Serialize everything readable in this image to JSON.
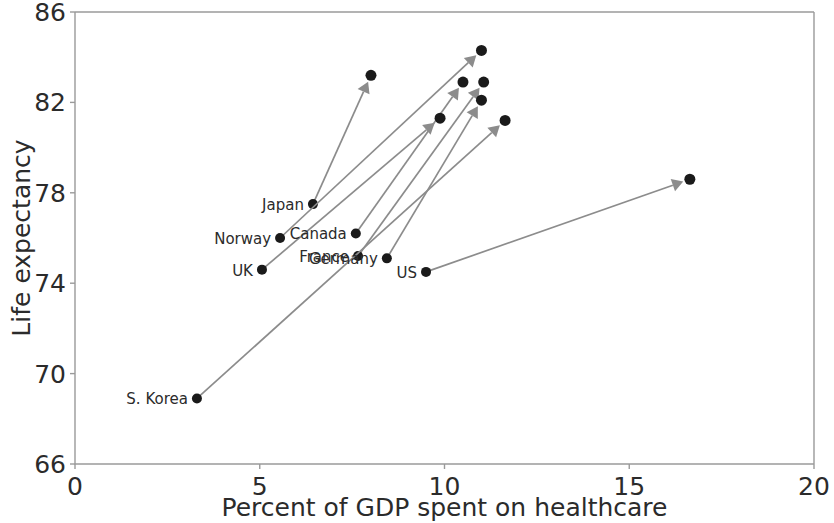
{
  "chart_data": {
    "type": "scatter",
    "title": "",
    "xlabel": "Percent of GDP spent on healthcare",
    "ylabel": "Life expectancy",
    "xlim": [
      0,
      20
    ],
    "ylim": [
      66,
      86
    ],
    "xticks": [
      "0",
      "5",
      "10",
      "15",
      "20"
    ],
    "xtick_values": [
      0,
      5,
      10,
      15,
      20
    ],
    "yticks": [
      "66",
      "70",
      "74",
      "78",
      "82",
      "86"
    ],
    "ytick_values": [
      66,
      70,
      74,
      78,
      82,
      86
    ],
    "grid": false,
    "legend": "none",
    "annotation_note": "Each country is drawn as a start dot with an arrow pointing to an end dot, showing change over time.",
    "series": [
      {
        "name": "Japan",
        "label": "Japan",
        "start": {
          "x": 6.44,
          "y": 77.5
        },
        "end": {
          "x": 8.01,
          "y": 83.2
        }
      },
      {
        "name": "Norway",
        "label": "Norway",
        "start": {
          "x": 5.55,
          "y": 76.0
        },
        "end": {
          "x": 11.0,
          "y": 84.3
        }
      },
      {
        "name": "Canada",
        "label": "Canada",
        "start": {
          "x": 7.6,
          "y": 76.2
        },
        "end": {
          "x": 10.5,
          "y": 82.9
        }
      },
      {
        "name": "France",
        "label": "France",
        "start": {
          "x": 7.66,
          "y": 75.2
        },
        "end": {
          "x": 11.06,
          "y": 82.9
        }
      },
      {
        "name": "Germany",
        "label": "Germany",
        "start": {
          "x": 8.44,
          "y": 75.1
        },
        "end": {
          "x": 11.0,
          "y": 82.1
        }
      },
      {
        "name": "UK",
        "label": "UK",
        "start": {
          "x": 5.06,
          "y": 74.6
        },
        "end": {
          "x": 9.88,
          "y": 81.3
        }
      },
      {
        "name": "US",
        "label": "US",
        "start": {
          "x": 9.5,
          "y": 74.5
        },
        "end": {
          "x": 16.64,
          "y": 78.6
        }
      },
      {
        "name": "S. Korea",
        "label": "S. Korea",
        "start": {
          "x": 3.3,
          "y": 68.9
        },
        "end": {
          "x": 11.64,
          "y": 81.2
        }
      }
    ],
    "colors": {
      "dot": "#1a1a1a",
      "arrow": "#8c8c8c",
      "axis": "#9a9a9a",
      "text": "#2b2b2b",
      "background": "#ffffff"
    }
  }
}
